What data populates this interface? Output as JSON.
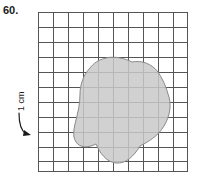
{
  "figure": {
    "problem_number": "60.",
    "scale_label": "1 cm",
    "scale_arrow_icon": "curved-arrow-right-icon",
    "region_icon": "irregular-blob-shape",
    "colors": {
      "grid_line": "#555555",
      "grid_background": "#ffffff",
      "blob_fill": "#c9c9c9",
      "blob_stroke": "#8a8a8a",
      "text": "#1a1a1a"
    },
    "grid": {
      "columns": 10,
      "rows": 11,
      "cell_size_px": 15,
      "cell_size_label": "1 cm",
      "origin_x_px": 38,
      "origin_y_px": 12,
      "width_px": 150,
      "height_px": 160
    },
    "blob": {
      "fill": "#c9c9c9",
      "stroke": "#8a8a8a",
      "stroke_width": 1,
      "path": "M 52,56 C 46,62 42,72 42,82 C 42,92 40,100 38,108 C 36,116 34,124 38,130 C 42,136 50,136 58,132 C 62,141 68,150 78,151 C 88,152 96,144 102,134 C 110,130 120,124 126,114 C 132,104 134,92 130,82 C 128,74 124,66 120,60 C 114,52 104,48 94,50 C 86,46 76,44 68,46 C 60,48 56,51 52,56 Z"
    }
  }
}
